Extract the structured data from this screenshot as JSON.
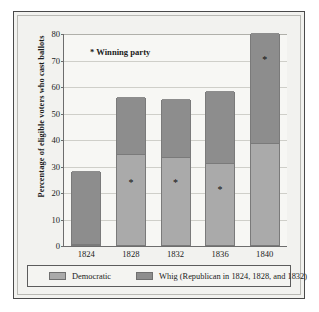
{
  "chart_data": {
    "type": "bar",
    "stacked": true,
    "title": "",
    "xlabel": "",
    "ylabel": "Percentage of eligible voters who cast ballots",
    "ylim": [
      0,
      80
    ],
    "yticks": [
      0,
      10,
      20,
      30,
      40,
      50,
      60,
      70,
      80
    ],
    "grid": true,
    "legend_position": "bottom",
    "categories": [
      "1824",
      "1828",
      "1832",
      "1836",
      "1840"
    ],
    "series": [
      {
        "name": "Democratic",
        "color": "#aaaaaa",
        "values": [
          0,
          34,
          33,
          30.5,
          38
        ]
      },
      {
        "name": "Whig (Republican in 1824, 1828, and 1832)",
        "color": "#8d8d8d",
        "values": [
          28,
          22,
          22,
          27.5,
          42
        ]
      }
    ],
    "totals": [
      28,
      56,
      55,
      58,
      80
    ],
    "annotations": [
      {
        "text": "* Winning party",
        "x": "1828",
        "y": 74
      }
    ],
    "winner_markers": [
      {
        "category": "1828",
        "y": 27.5,
        "glyph": "*"
      },
      {
        "category": "1832",
        "y": 27.5,
        "glyph": "*"
      },
      {
        "category": "1836",
        "y": 25,
        "glyph": "*"
      },
      {
        "category": "1840",
        "y": 74,
        "glyph": "*"
      }
    ]
  },
  "axis": {
    "y_title": "Percentage of eligible voters who cast ballots",
    "y_tick_labels": [
      "80",
      "70",
      "60",
      "50",
      "40",
      "30",
      "20",
      "10",
      "0"
    ],
    "x_tick_labels": [
      "1824",
      "1828",
      "1832",
      "1836",
      "1840"
    ]
  },
  "annotation": {
    "winning_party_note": "* Winning party"
  },
  "legend": {
    "items": [
      {
        "label": "Democratic",
        "color": "#aaaaaa"
      },
      {
        "label": "Whig (Republican in 1824, 1828, and 1832)",
        "color": "#8d8d8d"
      }
    ]
  }
}
